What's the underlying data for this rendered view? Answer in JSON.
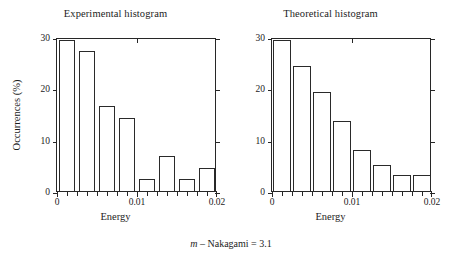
{
  "caption": {
    "symbol": "m",
    "text": " – Nakagami = 3.1"
  },
  "panels": [
    {
      "key": "experimental",
      "title": "Experimental histogram",
      "xlabel": "Energy",
      "ylabel": "Occurrences (%)"
    },
    {
      "key": "theoretical",
      "title": "Theoretical histogram",
      "xlabel": "Energy",
      "ylabel": ""
    }
  ],
  "axis": {
    "yticks": [
      0,
      10,
      20,
      30
    ],
    "ytick_labels": [
      "0",
      "10",
      "20",
      "30"
    ],
    "ylim": [
      0,
      30
    ],
    "xticks_major": [
      0,
      0.01,
      0.02
    ],
    "xtick_labels": [
      "0",
      "0.01",
      "0.02"
    ],
    "xlim": [
      0,
      0.02
    ],
    "xtick_minor_step": 0.00125
  },
  "chart_data": [
    {
      "type": "bar",
      "title": "Experimental histogram",
      "xlabel": "Energy",
      "ylabel": "Occurrences (%)",
      "xlim": [
        0,
        0.02
      ],
      "ylim": [
        0,
        30
      ],
      "grid": false,
      "legend": null,
      "bin_width": 0.0025,
      "bin_edges": [
        0,
        0.0025,
        0.005,
        0.0075,
        0.01,
        0.0125,
        0.015,
        0.0175,
        0.02
      ],
      "bin_centers": [
        0.00125,
        0.00375,
        0.00625,
        0.00875,
        0.01125,
        0.01375,
        0.01625,
        0.01875
      ],
      "categories": [
        "0-0.0025",
        "0.0025-0.005",
        "0.005-0.0075",
        "0.0075-0.01",
        "0.01-0.0125",
        "0.0125-0.015",
        "0.015-0.0175",
        "0.0175-0.02"
      ],
      "values": [
        29.5,
        27.3,
        16.5,
        14.3,
        2.4,
        6.8,
        2.4,
        4.5
      ],
      "bars_drawn": 8,
      "note": "Empirical occurrence percentages; non-monotonic with dips at bins 5 and 7."
    },
    {
      "type": "bar",
      "title": "Theoretical histogram",
      "xlabel": "Energy",
      "ylabel": "Occurrences (%)",
      "xlim": [
        0,
        0.02
      ],
      "ylim": [
        0,
        30
      ],
      "grid": false,
      "legend": null,
      "bin_width": 0.0025,
      "bin_edges": [
        0,
        0.0025,
        0.005,
        0.0075,
        0.01,
        0.0125,
        0.015,
        0.0175,
        0.02
      ],
      "bin_centers": [
        0.00125,
        0.00375,
        0.00625,
        0.00875,
        0.01125,
        0.01375,
        0.01625,
        0.01875
      ],
      "categories": [
        "0-0.0025",
        "0.0025-0.005",
        "0.005-0.0075",
        "0.0075-0.01",
        "0.01-0.0125",
        "0.0125-0.015",
        "0.015-0.0175",
        "0.0175-0.02"
      ],
      "values": [
        29.5,
        24.3,
        19.3,
        13.7,
        8.0,
        5.1,
        3.2,
        3.2
      ],
      "bars_drawn": 7,
      "note": "Nakagami model fit, m = 3.1; smooth monotonic decay. Last two bins equal height and drawn contiguously."
    }
  ]
}
